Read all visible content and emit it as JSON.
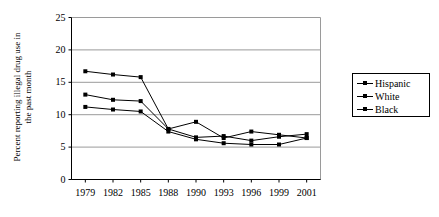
{
  "chart_data": {
    "type": "line",
    "title": "",
    "xlabel": "",
    "ylabel": "Percent reporting illegal drug use in the past month",
    "ylabel_line1": "Percent reporting illegal drug use in",
    "ylabel_line2": "the past month",
    "categories": [
      "1979",
      "1982",
      "1985",
      "1988",
      "1990",
      "1993",
      "1996",
      "1999",
      "2001"
    ],
    "ylim": [
      0,
      25
    ],
    "yticks": [
      0,
      5,
      10,
      15,
      20,
      25
    ],
    "ytick_labels": [
      "0",
      "5",
      "10",
      "15",
      "20",
      "25"
    ],
    "grid": true,
    "legend_position": "right",
    "series": [
      {
        "name": "Hispanic",
        "color": "#000000",
        "marker": "square",
        "values": [
          16.7,
          16.2,
          15.8,
          7.8,
          6.5,
          6.7,
          6.0,
          6.6,
          7.0
        ]
      },
      {
        "name": "White",
        "color": "#000000",
        "marker": "square",
        "values": [
          13.1,
          12.3,
          12.1,
          7.8,
          8.9,
          6.4,
          7.4,
          6.9,
          6.4
        ]
      },
      {
        "name": "Black",
        "color": "#000000",
        "marker": "square",
        "values": [
          11.2,
          10.8,
          10.5,
          7.4,
          6.2,
          5.6,
          5.4,
          5.4,
          6.4
        ]
      }
    ]
  },
  "legend": {
    "entries": [
      "Hispanic",
      "White",
      "Black"
    ]
  }
}
